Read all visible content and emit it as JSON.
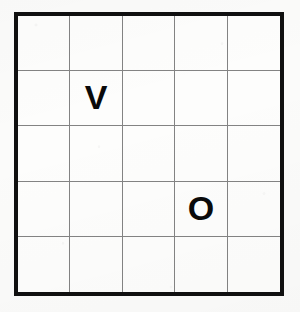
{
  "image": {
    "kind": "scanned-grid-puzzle",
    "background_color": "#fbfbfa",
    "paper_color": "#fdfdfc"
  },
  "grid": {
    "rows": 5,
    "columns": 5,
    "border_color": "#101010",
    "border_width_px": 4,
    "gridline_color": "#838383",
    "gridline_width_px": 1,
    "letter_color": "#0a0a0a",
    "cells": [
      [
        {
          "id": "r1c1",
          "letter": ""
        },
        {
          "id": "r1c2",
          "letter": ""
        },
        {
          "id": "r1c3",
          "letter": ""
        },
        {
          "id": "r1c4",
          "letter": ""
        },
        {
          "id": "r1c5",
          "letter": ""
        }
      ],
      [
        {
          "id": "r2c1",
          "letter": ""
        },
        {
          "id": "r2c2",
          "letter": "V"
        },
        {
          "id": "r2c3",
          "letter": ""
        },
        {
          "id": "r2c4",
          "letter": ""
        },
        {
          "id": "r2c5",
          "letter": ""
        }
      ],
      [
        {
          "id": "r3c1",
          "letter": ""
        },
        {
          "id": "r3c2",
          "letter": ""
        },
        {
          "id": "r3c3",
          "letter": ""
        },
        {
          "id": "r3c4",
          "letter": ""
        },
        {
          "id": "r3c5",
          "letter": ""
        }
      ],
      [
        {
          "id": "r4c1",
          "letter": ""
        },
        {
          "id": "r4c2",
          "letter": ""
        },
        {
          "id": "r4c3",
          "letter": ""
        },
        {
          "id": "r4c4",
          "letter": "O"
        },
        {
          "id": "r4c5",
          "letter": ""
        }
      ],
      [
        {
          "id": "r5c1",
          "letter": ""
        },
        {
          "id": "r5c2",
          "letter": ""
        },
        {
          "id": "r5c3",
          "letter": ""
        },
        {
          "id": "r5c4",
          "letter": ""
        },
        {
          "id": "r5c5",
          "letter": ""
        }
      ]
    ]
  }
}
